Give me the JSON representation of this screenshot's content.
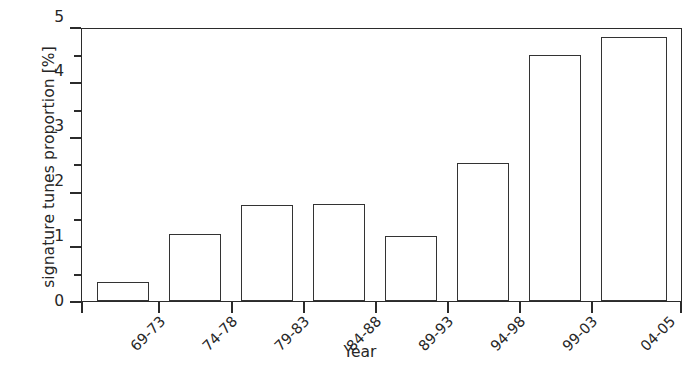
{
  "chart_data": {
    "type": "bar",
    "title": "",
    "xlabel": "Year",
    "ylabel": "signature tunes proportion [%]",
    "categories": [
      "69-73",
      "74-78",
      "79-83",
      "84-88",
      "89-93",
      "94-98",
      "99-03",
      "04-05"
    ],
    "values": [
      0.35,
      1.22,
      1.75,
      1.78,
      1.2,
      2.52,
      4.5,
      4.83
    ],
    "ylim": [
      0,
      5
    ],
    "ytick_labels": [
      "0",
      "1",
      "2",
      "3",
      "4",
      "5"
    ],
    "ytick_values": [
      0,
      1,
      2,
      3,
      4,
      5
    ],
    "yminor_values": [
      0.5,
      1.5,
      2.5,
      3.5,
      4.5
    ],
    "grid": false,
    "legend": false,
    "bar_face_color": "#ffffff",
    "bar_edge_color": "#333333",
    "axis_color": "#2b2b2b",
    "background_color": "#ffffff"
  }
}
